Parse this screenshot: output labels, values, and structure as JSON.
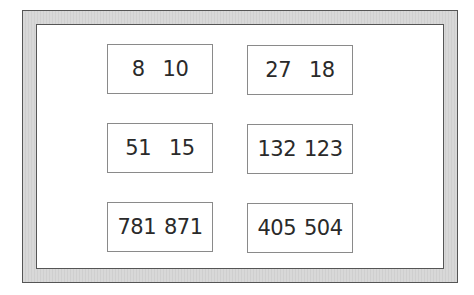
{
  "pairs": [
    {
      "a": "8",
      "b": "10"
    },
    {
      "a": "27",
      "b": "18"
    },
    {
      "a": "51",
      "b": "15"
    },
    {
      "a": "132",
      "b": "123"
    },
    {
      "a": "781",
      "b": "871"
    },
    {
      "a": "405",
      "b": "504"
    }
  ],
  "colors": {
    "frame_fill": "#d4d4d4",
    "frame_border": "#555555",
    "box_border": "#8a8a8a",
    "text": "#2a2a2a"
  }
}
